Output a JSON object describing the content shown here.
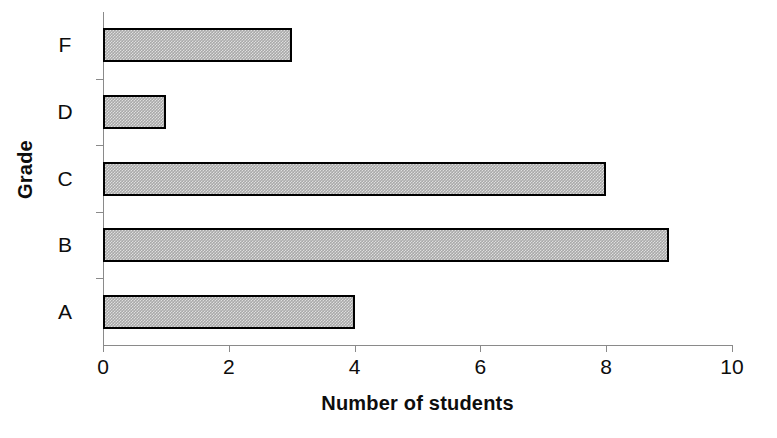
{
  "chart_data": {
    "type": "bar",
    "orientation": "horizontal",
    "title": "",
    "xlabel": "Number of students",
    "ylabel": "Grade",
    "categories": [
      "A",
      "B",
      "C",
      "D",
      "F"
    ],
    "values": [
      4,
      9,
      8,
      1,
      3
    ],
    "series": [
      {
        "name": "Number of students",
        "values": [
          4,
          9,
          8,
          1,
          3
        ]
      }
    ],
    "xlim": [
      0,
      10
    ],
    "xticks": [
      0,
      2,
      4,
      6,
      8,
      10
    ],
    "xtick_labels": [
      "0",
      "2",
      "4",
      "6",
      "8",
      "10"
    ],
    "ytick_labels_top_to_bottom": [
      "F",
      "D",
      "C",
      "B",
      "A"
    ],
    "grid": false,
    "legend": false,
    "legend_position": "none",
    "bar_fill_color": "#a9a9a9",
    "bar_border_color": "#000000",
    "axis_color": "#8a8a8a",
    "text_color": "#0d0d0d",
    "background_color": "#ffffff"
  },
  "axis": {
    "x_title": "Number of students",
    "y_title": "Grade",
    "x_ticks": [
      {
        "label": "0",
        "value": 0
      },
      {
        "label": "2",
        "value": 2
      },
      {
        "label": "4",
        "value": 4
      },
      {
        "label": "6",
        "value": 6
      },
      {
        "label": "8",
        "value": 8
      },
      {
        "label": "10",
        "value": 10
      }
    ],
    "y_categories": [
      {
        "label": "F",
        "value": 3
      },
      {
        "label": "D",
        "value": 1
      },
      {
        "label": "C",
        "value": 8
      },
      {
        "label": "B",
        "value": 9
      },
      {
        "label": "A",
        "value": 4
      }
    ]
  }
}
